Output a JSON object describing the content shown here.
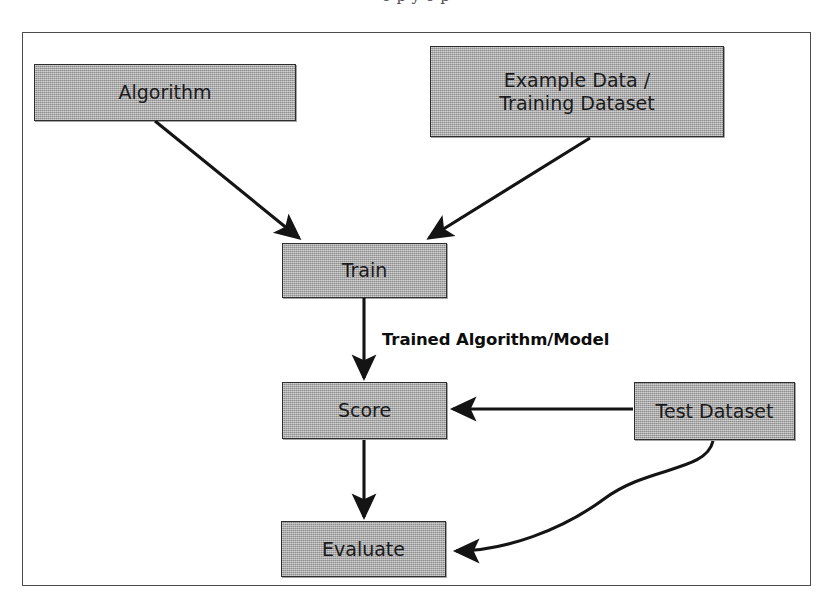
{
  "page": {
    "background_color": "#ffffff",
    "clipped_caption_fragment": "o p         y                 o      p"
  },
  "figure": {
    "frame": {
      "border_color": "#4c4c4c",
      "x": 22,
      "y": 32,
      "width": 789,
      "height": 554
    },
    "node_fill_color": "#a9a9a9",
    "node_border_color": "#2e2e2e",
    "edge_color": "#1a1a1a"
  },
  "nodes": [
    {
      "id": "algorithm",
      "label": "Algorithm",
      "x": 34,
      "y": 64,
      "width": 262,
      "height": 57
    },
    {
      "id": "example-data",
      "label": "Example Data /\nTraining Dataset",
      "x": 430,
      "y": 46,
      "width": 294,
      "height": 91
    },
    {
      "id": "train",
      "label": "Train",
      "x": 282,
      "y": 243,
      "width": 165,
      "height": 55
    },
    {
      "id": "score",
      "label": "Score",
      "x": 282,
      "y": 382,
      "width": 165,
      "height": 57
    },
    {
      "id": "test-dataset",
      "label": "Test Dataset",
      "x": 634,
      "y": 382,
      "width": 161,
      "height": 58
    },
    {
      "id": "evaluate",
      "label": "Evaluate",
      "x": 281,
      "y": 521,
      "width": 165,
      "height": 56
    }
  ],
  "edges": [
    {
      "id": "algorithm-to-train",
      "from": "algorithm",
      "to": "train",
      "shape": "straight",
      "points": "155,121 299,238",
      "arrowhead": true
    },
    {
      "id": "example-data-to-train",
      "from": "example-data",
      "to": "train",
      "shape": "straight",
      "points": "590,138 429,238",
      "arrowhead": true
    },
    {
      "id": "train-to-score",
      "from": "train",
      "to": "score",
      "shape": "straight",
      "points": "364,298 364,380",
      "arrowhead": true,
      "label": "Trained Algorithm/Model",
      "label_x": 382,
      "label_y": 330
    },
    {
      "id": "test-dataset-to-score",
      "from": "test-dataset",
      "to": "score",
      "shape": "straight",
      "points": "633,409 450,409",
      "arrowhead": true
    },
    {
      "id": "score-to-evaluate",
      "from": "score",
      "to": "evaluate",
      "shape": "straight",
      "points": "364,440 364,519",
      "arrowhead": true
    },
    {
      "id": "test-dataset-to-evaluate",
      "from": "test-dataset",
      "to": "evaluate",
      "shape": "curved",
      "path": "M 713 441 C 705 470, 650 468, 600 500 C 560 526, 500 550, 452 550",
      "arrowhead": true
    }
  ]
}
